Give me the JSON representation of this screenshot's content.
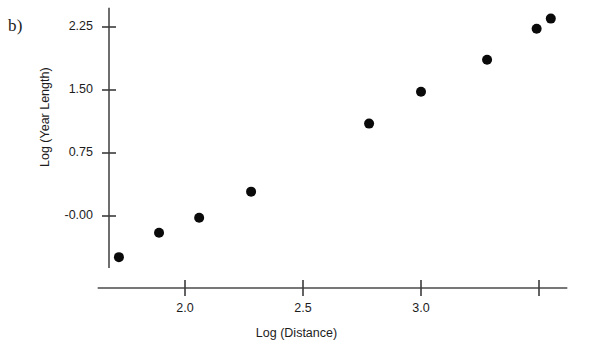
{
  "figure": {
    "panel_label": "b)",
    "background_color": "#ffffff",
    "point_color": "#0a0a0a",
    "axis_color": "#4a4a4a"
  },
  "chart_data": {
    "type": "scatter",
    "title": "",
    "xlabel": "Log (Distance)",
    "ylabel": "Log (Year Length)",
    "xlim": [
      1.63,
      3.62
    ],
    "ylim": [
      -0.62,
      2.48
    ],
    "grid": false,
    "legend": null,
    "xticks": [
      2.0,
      2.5,
      3.0,
      3.5
    ],
    "xtick_labels": [
      "2.0",
      "2.5",
      "3.0",
      ""
    ],
    "yticks": [
      2.25,
      1.5,
      0.75,
      0.0
    ],
    "ytick_labels": [
      "2.25",
      "1.50",
      "0.75",
      "-0.00"
    ],
    "x": [
      1.72,
      1.89,
      2.06,
      2.28,
      2.78,
      3.0,
      3.28,
      3.49,
      3.55
    ],
    "y": [
      -0.49,
      -0.2,
      -0.02,
      0.29,
      1.1,
      1.48,
      1.86,
      2.23,
      2.35
    ],
    "points": [
      {
        "x": 1.72,
        "y": -0.49
      },
      {
        "x": 1.89,
        "y": -0.2
      },
      {
        "x": 2.06,
        "y": -0.02
      },
      {
        "x": 2.28,
        "y": 0.29
      },
      {
        "x": 2.78,
        "y": 1.1
      },
      {
        "x": 3.0,
        "y": 1.48
      },
      {
        "x": 3.28,
        "y": 1.86
      },
      {
        "x": 3.49,
        "y": 2.23
      },
      {
        "x": 3.55,
        "y": 2.35
      }
    ],
    "marker": "circle",
    "marker_size": 5
  }
}
